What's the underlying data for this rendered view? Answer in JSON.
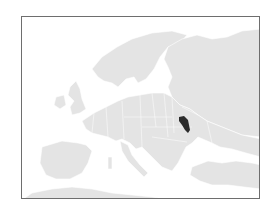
{
  "map": {
    "title": "Location of Moldova in Europe",
    "region": "Europe",
    "highlighted_country": "Moldova",
    "colors": {
      "land": "#e4e4e4",
      "sea": "#ffffff",
      "borders": "#ffffff",
      "highlight": "#2b2b2b",
      "frame": "#6e6e6e"
    }
  }
}
